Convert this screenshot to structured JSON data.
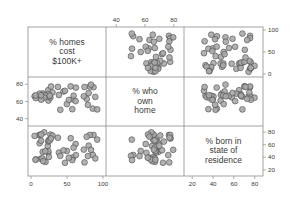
{
  "chart_data": {
    "type": "scatter",
    "subtype": "scatterplot-matrix",
    "title": "",
    "variables": [
      {
        "key": "homes100k",
        "label": [
          "% homes",
          "cost",
          "$100K+"
        ],
        "range": [
          0,
          100
        ],
        "ticks": [
          0,
          50,
          100
        ]
      },
      {
        "key": "ownHome",
        "label": [
          "% who",
          "own",
          "home"
        ],
        "range": [
          35,
          85
        ],
        "ticks": [
          40,
          60,
          80
        ]
      },
      {
        "key": "bornInState",
        "label": [
          "% born in",
          "state of",
          "residence"
        ],
        "range": [
          15,
          85
        ],
        "ticks": [
          20,
          40,
          60,
          80
        ]
      }
    ],
    "axes": {
      "bottom": [
        {
          "col": 0,
          "ticks": [
            "0",
            "50",
            "100"
          ]
        },
        {
          "col": 2,
          "ticks": [
            "20",
            "40",
            "60",
            "80"
          ]
        }
      ],
      "top": [
        {
          "col": 1,
          "ticks": [
            "40",
            "60",
            "80"
          ]
        }
      ],
      "left": [
        {
          "row": 1,
          "ticks": [
            "40",
            "60",
            "80"
          ]
        }
      ],
      "right": [
        {
          "row": 0,
          "ticks": [
            "0",
            "50",
            "100"
          ]
        },
        {
          "row": 2,
          "ticks": [
            "20",
            "40",
            "60",
            "80"
          ]
        }
      ]
    },
    "points_note": "Synthetic, seeded approximation of the visible point clouds; not transcribed point-by-point from the image",
    "points": [],
    "grid": false,
    "legend": null,
    "marker": {
      "shape": "circle",
      "fill": "#a9a9a9",
      "stroke": "#4a4a4a",
      "radius": 2.9
    },
    "colors": {
      "frame": "#8c8c8c",
      "text": "#3a3a3a",
      "marker_fill": "#a9a9a9",
      "marker_stroke": "#4a4a4a"
    }
  }
}
